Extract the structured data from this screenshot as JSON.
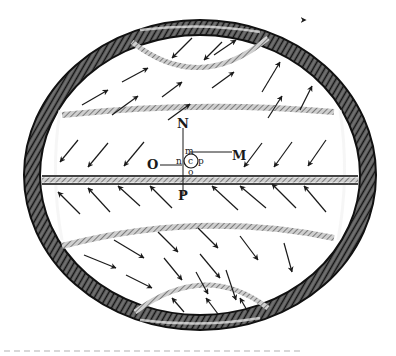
{
  "figure": {
    "labels": {
      "N": "N",
      "M": "M",
      "O": "O",
      "P": "P",
      "m": "m",
      "n": "n",
      "c": "c",
      "p": "p",
      "o": "o"
    },
    "caption_fragment": ""
  },
  "colors": {
    "ink": "#1a1a1a",
    "shell_dark": "#2a2a2a",
    "shell_mid": "#6a6a6a",
    "band": "#8a8a8a",
    "paper": "#ffffff"
  },
  "arrow_fields": [
    {
      "region": "top-cap",
      "direction": "down-left"
    },
    {
      "region": "upper-zone",
      "direction": "up-right"
    },
    {
      "region": "upper-equatorial",
      "direction": "down-left"
    },
    {
      "region": "lower-equatorial",
      "direction": "up-left"
    },
    {
      "region": "lower-zone",
      "direction": "down-right"
    },
    {
      "region": "bottom-cap",
      "direction": "up-left"
    }
  ]
}
